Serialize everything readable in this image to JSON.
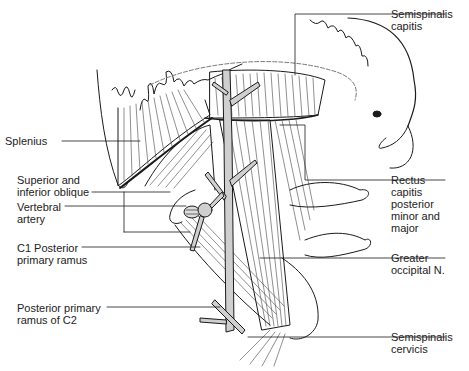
{
  "figure": {
    "line_color": "#1a1a1a",
    "nerve_fill": "#cfcfcf",
    "background": "#ffffff"
  },
  "labels": {
    "left": [
      {
        "id": "splenius",
        "lines": [
          "Splenius"
        ]
      },
      {
        "id": "oblique",
        "lines": [
          "Superior and",
          "inferior oblique"
        ]
      },
      {
        "id": "vertebral_artery",
        "lines": [
          "Vertebral",
          "artery"
        ]
      },
      {
        "id": "c1_ramus",
        "lines": [
          "C1 Posterior",
          "primary ramus"
        ]
      },
      {
        "id": "c2_ramus",
        "lines": [
          "Posterior primary",
          "ramus of C2"
        ]
      }
    ],
    "right": [
      {
        "id": "semispinalis_capitis",
        "lines": [
          "Semispinalis",
          "capitis"
        ]
      },
      {
        "id": "rectus_capitis",
        "lines": [
          "Rectus",
          "capitis",
          "posterior",
          "minor and",
          "major"
        ]
      },
      {
        "id": "greater_occipital",
        "lines": [
          "Greater",
          "occipital N."
        ]
      },
      {
        "id": "semispinalis_cervicis",
        "lines": [
          "Semispinalis",
          "cervicis"
        ]
      }
    ]
  }
}
